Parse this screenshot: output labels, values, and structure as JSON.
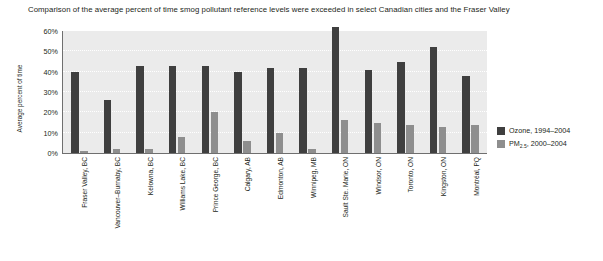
{
  "caption": "Comparison of the average percent of time smog pollutant reference levels were exceeded in select Canadian cities and the Fraser Valley",
  "chart_data": {
    "type": "bar",
    "title": "Comparison of the average percent of time smog pollutant reference levels were exceeded in select Canadian cities and the Fraser Valley",
    "xlabel": "",
    "ylabel": "Average percent of time",
    "ylim": [
      0,
      60
    ],
    "yticks": [
      "0%",
      "10%",
      "20%",
      "30%",
      "40%",
      "50%",
      "60%"
    ],
    "ytick_values": [
      0,
      10,
      20,
      30,
      40,
      50,
      60
    ],
    "grid": true,
    "legend_position": "right",
    "categories": [
      "Fraser Valley, BC",
      "Vancouver–Burnaby, BC",
      "Kelowna, BC",
      "Williams Lake, BC",
      "Prince George, BC",
      "Calgary, AB",
      "Edmonton, AB",
      "Winnipeg, MB",
      "Sault Ste. Marie, ON",
      "Windsor, ON",
      "Toronto, ON",
      "Kingston, ON",
      "Montréal, PQ"
    ],
    "series": [
      {
        "name": "Ozone, 1994–2004",
        "color": "#3f3f3f",
        "values": [
          40,
          26,
          43,
          43,
          43,
          40,
          42,
          42,
          62,
          41,
          45,
          52,
          38
        ]
      },
      {
        "name": "PM2.5, 2000–2004",
        "color": "#8e8e8e",
        "values": [
          1,
          2,
          2,
          8,
          20,
          6,
          10,
          2,
          16,
          15,
          14,
          13,
          14
        ]
      }
    ]
  },
  "legend": {
    "items": [
      {
        "label_main": "Ozone, 1994–2004",
        "color": "#3f3f3f"
      },
      {
        "label_prefix": "PM",
        "label_sub": "2.5",
        "label_suffix": ", 2000–2004",
        "color": "#8e8e8e"
      }
    ]
  },
  "colors": {
    "plot_background": "#ebebeb",
    "gridline": "#ffffff",
    "axis": "#6f6f6f",
    "text": "#231f20",
    "ozone": "#3f3f3f",
    "pm25": "#8e8e8e"
  }
}
